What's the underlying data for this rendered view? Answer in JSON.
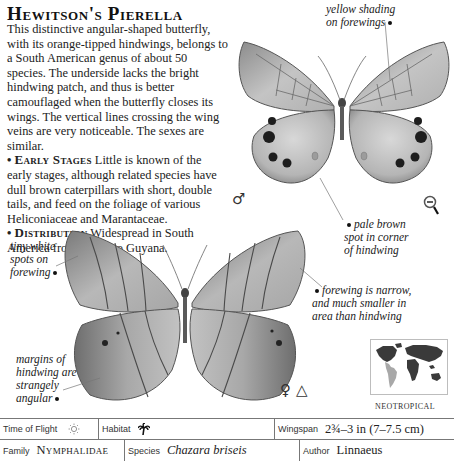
{
  "title": "Hewitson's Pierella",
  "description": {
    "intro": "This distinctive angular-shaped butterfly, with its orange-tipped hindwings, belongs to a South American genus of about 50 species. The underside lacks the bright hindwing patch, and thus is better camouflaged when the butterfly closes its wings. The vertical lines crossing the wing veins are very noticeable. The sexes are similar.",
    "early_stages_label": "Early Stages",
    "early_stages_text": "Little is known of the early stages, although related species have dull brown caterpillars with short, double tails, and feed on the foliage of various Heliconiaceae and Marantaceae.",
    "distribution_label": "Distribution",
    "distribution_text": "Widespread in South America from Brazil to Guyana.",
    "bullet": "•"
  },
  "annotations": {
    "yellow_shading": "yellow shading\non forewings",
    "pale_brown_spot": "pale brown\nspot in corner\nof hindwing",
    "tiny_white_spots": "tiny white\nspots on\nforewing",
    "forewing_narrow": "forewing is narrow,\nand much smaller in\narea than hindwing",
    "margins_angular": "margins of\nhindwing are\nstrangely\nangular"
  },
  "symbols": {
    "male": "♂",
    "female": "♀",
    "triangle": "△"
  },
  "map": {
    "label": "NEOTROPICAL",
    "land_color": "#3a3a3a",
    "highlight_color": "#a8a8a8"
  },
  "table": {
    "time_of_flight_label": "Time of Flight",
    "habitat_label": "Habitat",
    "wingspan_label": "Wingspan",
    "wingspan_value": "2¾–3 in (7–7.5 cm)",
    "family_label": "Family",
    "family_value": "Nymphalidae",
    "species_label": "Species",
    "species_value": "Chazara briseis",
    "author_label": "Author",
    "author_value": "Linnaeus"
  }
}
